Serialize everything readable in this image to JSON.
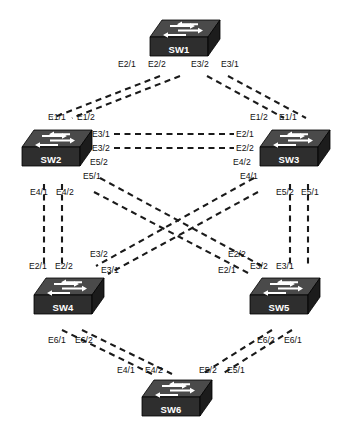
{
  "diagram": {
    "type": "network-topology",
    "background_color": "#ffffff",
    "link_style": "dashed",
    "link_color": "#1a1a1a",
    "device_top_color": "#4a4a4a",
    "device_front_color": "#2e2e2e",
    "device_side_color": "#1c1c1c",
    "device_label_color": "#ffffff"
  },
  "devices": [
    {
      "id": "sw1",
      "label": "SW1",
      "x": 148,
      "y": 18,
      "icon": "switch-icon"
    },
    {
      "id": "sw2",
      "label": "SW2",
      "x": 20,
      "y": 128,
      "icon": "switch-icon"
    },
    {
      "id": "sw3",
      "label": "SW3",
      "x": 258,
      "y": 128,
      "icon": "switch-icon"
    },
    {
      "id": "sw4",
      "label": "SW4",
      "x": 32,
      "y": 276,
      "icon": "switch-icon"
    },
    {
      "id": "sw5",
      "label": "SW5",
      "x": 248,
      "y": 276,
      "icon": "switch-icon"
    },
    {
      "id": "sw6",
      "label": "SW6",
      "x": 140,
      "y": 378,
      "icon": "switch-icon"
    }
  ],
  "links": [
    {
      "from": "sw1",
      "to": "sw2",
      "from_port": "E2/1",
      "to_port": "E1/1",
      "x1": 160,
      "y1": 76,
      "x2": 52,
      "y2": 118
    },
    {
      "from": "sw1",
      "to": "sw2",
      "from_port": "E2/2",
      "to_port": "E1/2",
      "x1": 180,
      "y1": 76,
      "x2": 72,
      "y2": 118
    },
    {
      "from": "sw1",
      "to": "sw3",
      "from_port": "E3/2",
      "to_port": "E1/2",
      "x1": 207,
      "y1": 76,
      "x2": 284,
      "y2": 118
    },
    {
      "from": "sw1",
      "to": "sw3",
      "from_port": "E3/1",
      "to_port": "E1/1",
      "x1": 228,
      "y1": 76,
      "x2": 306,
      "y2": 118
    },
    {
      "from": "sw2",
      "to": "sw3",
      "from_port": "E3/1",
      "to_port": "E2/1",
      "x1": 114,
      "y1": 134,
      "x2": 234,
      "y2": 134
    },
    {
      "from": "sw2",
      "to": "sw3",
      "from_port": "E3/2",
      "to_port": "E2/2",
      "x1": 114,
      "y1": 148,
      "x2": 234,
      "y2": 148
    },
    {
      "from": "sw2",
      "to": "sw4",
      "from_port": "E4/1",
      "to_port": "E2/1",
      "x1": 44,
      "y1": 184,
      "x2": 44,
      "y2": 268
    },
    {
      "from": "sw2",
      "to": "sw4",
      "from_port": "E4/2",
      "to_port": "E2/2",
      "x1": 62,
      "y1": 184,
      "x2": 62,
      "y2": 268
    },
    {
      "from": "sw3",
      "to": "sw5",
      "from_port": "E5/2",
      "to_port": "E3/2",
      "x1": 290,
      "y1": 184,
      "x2": 290,
      "y2": 268
    },
    {
      "from": "sw3",
      "to": "sw5",
      "from_port": "E5/1",
      "to_port": "E3/1",
      "x1": 308,
      "y1": 184,
      "x2": 308,
      "y2": 268
    },
    {
      "from": "sw2",
      "to": "sw5",
      "from_port": "E5/2",
      "to_port": "E2/2",
      "x1": 100,
      "y1": 178,
      "x2": 262,
      "y2": 266
    },
    {
      "from": "sw2",
      "to": "sw5",
      "from_port": "E5/1",
      "to_port": "E2/1",
      "x1": 94,
      "y1": 192,
      "x2": 250,
      "y2": 274
    },
    {
      "from": "sw3",
      "to": "sw4",
      "from_port": "E4/2",
      "to_port": "E3/2",
      "x1": 254,
      "y1": 178,
      "x2": 96,
      "y2": 266
    },
    {
      "from": "sw3",
      "to": "sw4",
      "from_port": "E4/1",
      "to_port": "E3/1",
      "x1": 258,
      "y1": 192,
      "x2": 108,
      "y2": 274
    },
    {
      "from": "sw4",
      "to": "sw6",
      "from_port": "E6/1",
      "to_port": "E4/1",
      "x1": 62,
      "y1": 330,
      "x2": 152,
      "y2": 374
    },
    {
      "from": "sw4",
      "to": "sw6",
      "from_port": "E6/2",
      "to_port": "E4/2",
      "x1": 82,
      "y1": 330,
      "x2": 172,
      "y2": 374
    },
    {
      "from": "sw5",
      "to": "sw6",
      "from_port": "E6/2",
      "to_port": "E5/2",
      "x1": 272,
      "y1": 330,
      "x2": 202,
      "y2": 374
    },
    {
      "from": "sw5",
      "to": "sw6",
      "from_port": "E6/1",
      "to_port": "E5/1",
      "x1": 292,
      "y1": 330,
      "x2": 222,
      "y2": 374
    }
  ],
  "port_labels": [
    {
      "id": "sw1-e21",
      "device": "sw1",
      "text": "E2/1",
      "x": 118,
      "y": 60
    },
    {
      "id": "sw1-e22",
      "device": "sw1",
      "text": "E2/2",
      "x": 148,
      "y": 60
    },
    {
      "id": "sw1-e32",
      "device": "sw1",
      "text": "E3/2",
      "x": 191,
      "y": 60
    },
    {
      "id": "sw1-e31",
      "device": "sw1",
      "text": "E3/1",
      "x": 221,
      "y": 60
    },
    {
      "id": "sw2-e11",
      "device": "sw2",
      "text": "E1/1",
      "x": 48,
      "y": 113
    },
    {
      "id": "sw2-e12",
      "device": "sw2",
      "text": "E1/2",
      "x": 77,
      "y": 113
    },
    {
      "id": "sw2-e31",
      "device": "sw2",
      "text": "E3/1",
      "x": 92,
      "y": 130
    },
    {
      "id": "sw2-e32",
      "device": "sw2",
      "text": "E3/2",
      "x": 92,
      "y": 144
    },
    {
      "id": "sw2-e52",
      "device": "sw2",
      "text": "E5/2",
      "x": 90,
      "y": 158
    },
    {
      "id": "sw2-e51",
      "device": "sw2",
      "text": "E5/1",
      "x": 83,
      "y": 172
    },
    {
      "id": "sw2-e41",
      "device": "sw2",
      "text": "E4/1",
      "x": 30,
      "y": 188
    },
    {
      "id": "sw2-e42",
      "device": "sw2",
      "text": "E4/2",
      "x": 56,
      "y": 188
    },
    {
      "id": "sw3-e12",
      "device": "sw3",
      "text": "E1/2",
      "x": 250,
      "y": 113
    },
    {
      "id": "sw3-e11",
      "device": "sw3",
      "text": "E1/1",
      "x": 279,
      "y": 113
    },
    {
      "id": "sw3-e21",
      "device": "sw3",
      "text": "E2/1",
      "x": 236,
      "y": 130
    },
    {
      "id": "sw3-e22",
      "device": "sw3",
      "text": "E2/2",
      "x": 236,
      "y": 144
    },
    {
      "id": "sw3-e42",
      "device": "sw3",
      "text": "E4/2",
      "x": 233,
      "y": 158
    },
    {
      "id": "sw3-e41",
      "device": "sw3",
      "text": "E4/1",
      "x": 240,
      "y": 172
    },
    {
      "id": "sw3-e52",
      "device": "sw3",
      "text": "E5/2",
      "x": 276,
      "y": 188
    },
    {
      "id": "sw3-e51",
      "device": "sw3",
      "text": "E5/1",
      "x": 301,
      "y": 188
    },
    {
      "id": "sw4-e21",
      "device": "sw4",
      "text": "E2/1",
      "x": 29,
      "y": 262
    },
    {
      "id": "sw4-e22",
      "device": "sw4",
      "text": "E2/2",
      "x": 55,
      "y": 262
    },
    {
      "id": "sw4-e32",
      "device": "sw4",
      "text": "E3/2",
      "x": 90,
      "y": 250
    },
    {
      "id": "sw4-e31",
      "device": "sw4",
      "text": "E3/1",
      "x": 101,
      "y": 266
    },
    {
      "id": "sw4-e61",
      "device": "sw4",
      "text": "E6/1",
      "x": 48,
      "y": 336
    },
    {
      "id": "sw4-e62",
      "device": "sw4",
      "text": "E6/2",
      "x": 75,
      "y": 336
    },
    {
      "id": "sw5-e22",
      "device": "sw5",
      "text": "E2/2",
      "x": 228,
      "y": 250
    },
    {
      "id": "sw5-e21",
      "device": "sw5",
      "text": "E2/1",
      "x": 218,
      "y": 266
    },
    {
      "id": "sw5-e32",
      "device": "sw5",
      "text": "E3/2",
      "x": 250,
      "y": 262
    },
    {
      "id": "sw5-e31",
      "device": "sw5",
      "text": "E3/1",
      "x": 276,
      "y": 262
    },
    {
      "id": "sw5-e62",
      "device": "sw5",
      "text": "E6/2",
      "x": 257,
      "y": 336
    },
    {
      "id": "sw5-e61",
      "device": "sw5",
      "text": "E6/1",
      "x": 284,
      "y": 336
    },
    {
      "id": "sw6-e41",
      "device": "sw6",
      "text": "E4/1",
      "x": 117,
      "y": 366
    },
    {
      "id": "sw6-e42",
      "device": "sw6",
      "text": "E4/2",
      "x": 145,
      "y": 366
    },
    {
      "id": "sw6-e52",
      "device": "sw6",
      "text": "E5/2",
      "x": 199,
      "y": 366
    },
    {
      "id": "sw6-e51",
      "device": "sw6",
      "text": "E5/1",
      "x": 227,
      "y": 366
    }
  ]
}
